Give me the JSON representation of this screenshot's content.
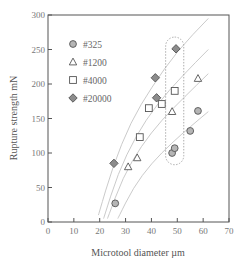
{
  "chart_data": {
    "type": "scatter",
    "title": "",
    "xlabel": "Microtool diameter µm",
    "ylabel": "Rupture strength mN",
    "xlim": [
      0,
      70
    ],
    "ylim": [
      0,
      300
    ],
    "xticks": [
      0,
      10,
      20,
      30,
      40,
      50,
      60,
      70
    ],
    "yticks": [
      0,
      50,
      100,
      150,
      200,
      250,
      300
    ],
    "grid": false,
    "legend_position": "upper-left",
    "series": [
      {
        "name": "#325",
        "marker": "circle",
        "fill": "#b5b5b5",
        "points": [
          [
            26,
            27
          ],
          [
            48,
            100
          ],
          [
            49,
            107
          ],
          [
            55,
            132
          ],
          [
            58,
            161
          ]
        ]
      },
      {
        "name": "#1200",
        "marker": "triangle",
        "fill": "#ffffff",
        "points": [
          [
            31,
            80
          ],
          [
            34.5,
            93
          ],
          [
            48,
            160
          ],
          [
            58,
            208
          ]
        ]
      },
      {
        "name": "#4000",
        "marker": "square",
        "fill": "#ffffff",
        "points": [
          [
            35.5,
            123
          ],
          [
            39,
            165
          ],
          [
            44,
            171
          ],
          [
            49,
            190
          ]
        ]
      },
      {
        "name": "#20000",
        "marker": "diamond",
        "fill": "#8c8c8c",
        "points": [
          [
            25.5,
            85
          ],
          [
            41.5,
            209
          ],
          [
            42,
            180
          ],
          [
            49.5,
            251
          ]
        ]
      }
    ],
    "fit_curves": [
      {
        "for": "#20000",
        "points": [
          [
            19.5,
            10
          ],
          [
            25,
            80
          ],
          [
            32,
            145
          ],
          [
            40,
            195
          ],
          [
            50,
            248
          ],
          [
            62,
            295
          ]
        ]
      },
      {
        "for": "#4000",
        "points": [
          [
            21.5,
            5
          ],
          [
            27,
            70
          ],
          [
            34,
            125
          ],
          [
            42,
            170
          ],
          [
            52,
            212
          ],
          [
            62,
            250
          ]
        ]
      },
      {
        "for": "#1200",
        "points": [
          [
            23,
            5
          ],
          [
            29,
            65
          ],
          [
            36,
            110
          ],
          [
            44,
            148
          ],
          [
            53,
            182
          ],
          [
            62,
            215
          ]
        ]
      },
      {
        "for": "#325",
        "points": [
          [
            27,
            5
          ],
          [
            33,
            50
          ],
          [
            40,
            85
          ],
          [
            48,
            115
          ],
          [
            55,
            138
          ],
          [
            62,
            160
          ]
        ]
      }
    ],
    "annotations": [
      {
        "type": "dotted-rounded-box",
        "x_range": [
          45.5,
          52.5
        ],
        "y_range": [
          83,
          268
        ]
      }
    ]
  }
}
